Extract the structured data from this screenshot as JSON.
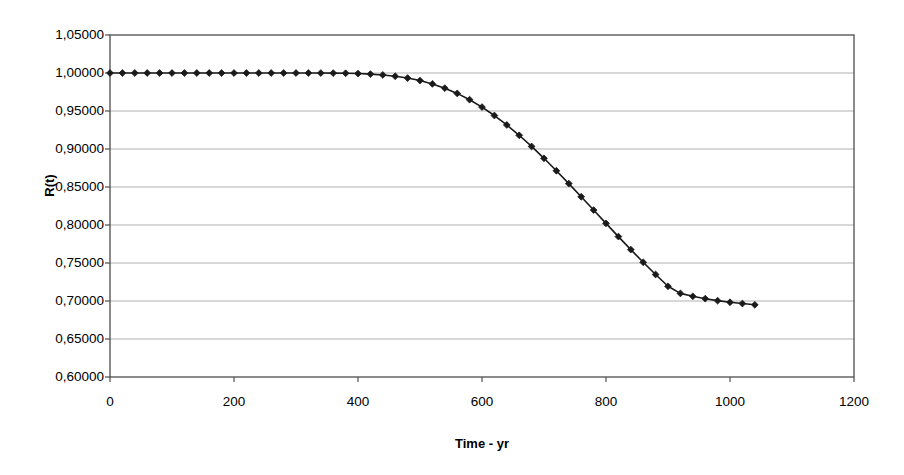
{
  "chart_data": {
    "type": "line",
    "title": "",
    "xlabel": "Time - yr",
    "ylabel": "R(t)",
    "xlim": [
      0,
      1200
    ],
    "ylim": [
      0.6,
      1.05
    ],
    "grid": true,
    "legend": false,
    "marker": "diamond",
    "line_color": "#1a1a1a",
    "marker_color": "#1a1a1a",
    "grid_color": "#a8a8a8",
    "axis_color": "#4d4d4d",
    "decimal_separator": ",",
    "x_tick_labels": [
      "0",
      "200",
      "400",
      "600",
      "800",
      "1000",
      "1200"
    ],
    "x_ticks": [
      0,
      200,
      400,
      600,
      800,
      1000,
      1200
    ],
    "y_tick_labels": [
      "1,05000",
      "1,00000",
      "0,95000",
      "0,90000",
      "0,85000",
      "0,80000",
      "0,75000",
      "0,70000",
      "0,65000",
      "0,60000"
    ],
    "y_ticks": [
      1.05,
      1.0,
      0.95,
      0.9,
      0.85,
      0.8,
      0.75,
      0.7,
      0.65,
      0.6
    ],
    "series": [
      {
        "name": "R(t)",
        "x": [
          0,
          20,
          40,
          60,
          80,
          100,
          120,
          140,
          160,
          180,
          200,
          220,
          240,
          260,
          280,
          300,
          320,
          340,
          360,
          380,
          400,
          420,
          440,
          460,
          480,
          500,
          520,
          540,
          560,
          580,
          600,
          620,
          640,
          660,
          680,
          700,
          720,
          740,
          760,
          780,
          800,
          820,
          840,
          860,
          880,
          900,
          920,
          940,
          960,
          980,
          1000,
          1020,
          1040
        ],
        "values": [
          1.0,
          1.0,
          1.0,
          1.0,
          1.0,
          1.0,
          1.0,
          1.0,
          1.0,
          1.0,
          1.0,
          1.0,
          1.0,
          1.0,
          1.0,
          1.0,
          1.0,
          0.99995,
          0.99985,
          0.99965,
          0.99925,
          0.99855,
          0.99745,
          0.99575,
          0.99335,
          0.99005,
          0.98565,
          0.98005,
          0.97315,
          0.96485,
          0.95515,
          0.94405,
          0.93165,
          0.91805,
          0.90335,
          0.88775,
          0.87135,
          0.85445,
          0.83715,
          0.81965,
          0.80215,
          0.78475,
          0.76765,
          0.75095,
          0.73485,
          0.71935,
          0.71,
          0.70615,
          0.70305,
          0.70045,
          0.69835,
          0.69665,
          0.695
        ]
      }
    ]
  },
  "geometry": {
    "plot_left": 110,
    "plot_right": 854,
    "plot_top": 35,
    "plot_bottom": 377
  }
}
